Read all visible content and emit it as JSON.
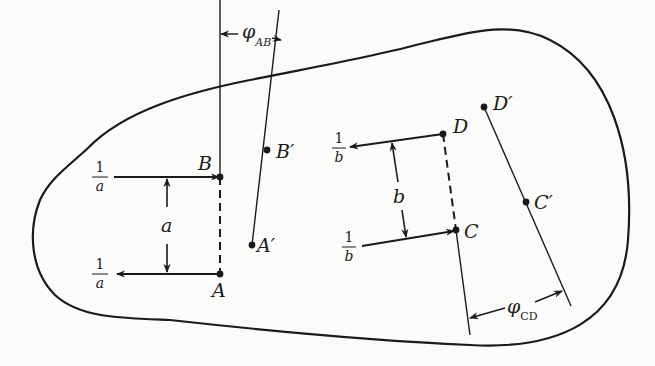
{
  "diagram": {
    "type": "rigid-body-rotation-couples",
    "colors": {
      "stroke": "#1a1a1a",
      "background": "#fbfbf9"
    },
    "points": {
      "A": "A",
      "B": "B",
      "A_prime": "A′",
      "B_prime": "B′",
      "C": "C",
      "D": "D",
      "C_prime": "C′",
      "D_prime": "D′"
    },
    "couple_ab": {
      "force_top": {
        "num": "1",
        "den": "a"
      },
      "force_bottom": {
        "num": "1",
        "den": "a"
      },
      "arm": "a"
    },
    "couple_cd": {
      "force_top": {
        "num": "1",
        "den": "b"
      },
      "force_bottom": {
        "num": "1",
        "den": "b"
      },
      "arm": "b"
    },
    "angles": {
      "phi_ab": {
        "symbol": "φ",
        "sub": "AB"
      },
      "phi_cd": {
        "symbol": "φ",
        "sub": "CD"
      }
    }
  }
}
